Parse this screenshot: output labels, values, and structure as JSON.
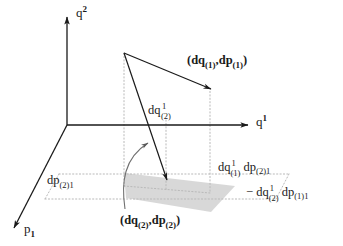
{
  "figure": {
    "background_color": "#ffffff",
    "line_color": "#1a1a1a",
    "dotted_color": "#b9b9b9",
    "shade_color": "#c9c9c9",
    "arc_color": "#6f6f6f"
  },
  "axes": [
    {
      "name": "q2-axis",
      "symbol": "q",
      "exponent": "2",
      "label_text": "q 2",
      "direction": "up"
    },
    {
      "name": "q1-axis",
      "symbol": "q",
      "exponent": "1",
      "label_text": "q 1",
      "direction": "right"
    },
    {
      "name": "p1-axis",
      "symbol": "p",
      "index": "1",
      "label_text": "p 1",
      "direction": "down-left"
    }
  ],
  "vectors": [
    {
      "name": "vector-1",
      "label_prefix": "(",
      "label_q": "dq",
      "label_q_sub": "(1)",
      "label_sep": ",",
      "label_p": "dp",
      "label_p_sub": "(1)",
      "label_suffix": ")",
      "full_label": "(dq(1),dp(1))"
    },
    {
      "name": "vector-2",
      "label_prefix": "(",
      "label_q": "dq",
      "label_q_sub": "(2)",
      "label_sep": ",",
      "label_p": "dp",
      "label_p_sub": "(2)",
      "label_suffix": ")",
      "full_label": "(dq(2),dp(2))"
    }
  ],
  "components": {
    "dq2_component": {
      "base": "dq",
      "upper": "1",
      "lower": "(2)",
      "full_label": "dq^1_(2)"
    },
    "dp21_component": {
      "base": "dp",
      "lower": "(2)1",
      "full_label": "dp_(2)1"
    }
  },
  "formula": {
    "line1": {
      "term1_base": "dq",
      "term1_upper": "1",
      "term1_lower": "(1)",
      "term2_base": "dp",
      "term2_lower": "(2)1"
    },
    "line2": {
      "minus": "−",
      "term1_base": "dq",
      "term1_upper": "1",
      "term1_lower": "(2)",
      "term2_base": "dp",
      "term2_lower": "(1)1"
    },
    "plain_text": "dq^1_(1) dp_(2)1 - dq^1_(2) dp_(1)1"
  }
}
